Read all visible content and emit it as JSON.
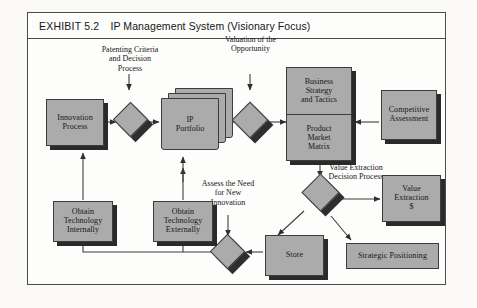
{
  "exhibit": {
    "label": "EXHIBIT 5.2",
    "title": "IP Management System (Visionary Focus)"
  },
  "colors": {
    "node_fill": "#ababab",
    "node_border": "#3d3d3d",
    "shadow": "#2a2a2a",
    "frame_border": "#4a4a4a",
    "page_background": "#fbfaf8",
    "canvas_background": "#fdfdfc",
    "connector": "#3d3d3d",
    "text": "#16161a"
  },
  "nodes": {
    "innovation_process": {
      "line1": "Innovation",
      "line2": "Process"
    },
    "ip_portfolio": {
      "line1": "IP",
      "line2": "Portfolio"
    },
    "business_strategy": {
      "line1": "Business",
      "line2": "Strategy",
      "line3": "and Tactics"
    },
    "product_market_matrix": {
      "line1": "Product",
      "line2": "Market",
      "line3": "Matrix"
    },
    "competitive_assessment": {
      "line1": "Competitive",
      "line2": "Assessment"
    },
    "obtain_technology_internally": {
      "line1": "Obtain",
      "line2": "Technology",
      "line3": "Internally"
    },
    "obtain_technology_externally": {
      "line1": "Obtain",
      "line2": "Technology",
      "line3": "Externally"
    },
    "value_extraction": {
      "line1": "Value",
      "line2": "Extraction",
      "line3": "$"
    },
    "store": {
      "line1": "Store"
    },
    "strategic_positioning": {
      "line1": "Strategic Positioning"
    }
  },
  "captions": {
    "patenting_criteria": {
      "line1": "Patenting Criteria",
      "line2": "and Decision",
      "line3": "Process"
    },
    "valuation_opportunity": {
      "line1": "Valuation of the",
      "line2": "Opportunity"
    },
    "value_extraction_decision": {
      "line1": "Value Extraction",
      "line2": "Decision Process"
    },
    "assess_need": {
      "line1": "Assess the Need",
      "line2": "for New",
      "line3": "Innovation"
    }
  },
  "decision_nodes": {
    "patenting_decision": "patenting-criteria-decision-diamond",
    "valuation_decision": "valuation-opportunity-diamond",
    "value_extraction_decision": "value-extraction-decision-diamond",
    "assess_need_decision": "assess-need-decision-diamond"
  }
}
